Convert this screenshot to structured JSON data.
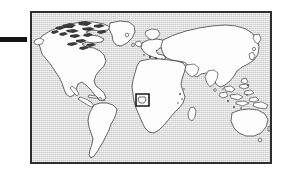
{
  "figure": {
    "kind": "world-locator-map",
    "projection_label": "",
    "caption": ""
  },
  "leader_bar": {
    "label": "",
    "color": "#141414"
  },
  "map": {
    "frame_color": "#2e2e2e",
    "ocean_color": "#cccccc",
    "land_color": "#fdfdfd",
    "coast_color": "#2b2b2b",
    "title": "",
    "graticule": false
  },
  "highlight": {
    "label": "",
    "region_name": "Gulf of Guinea / Central Africa",
    "box_color": "#181818"
  },
  "landmasses": [
    {
      "name": "North America"
    },
    {
      "name": "South America"
    },
    {
      "name": "Greenland"
    },
    {
      "name": "Europe"
    },
    {
      "name": "Africa"
    },
    {
      "name": "Asia"
    },
    {
      "name": "Australia"
    },
    {
      "name": "Madagascar"
    },
    {
      "name": "Japan"
    },
    {
      "name": "New Zealand"
    },
    {
      "name": "Indonesia"
    },
    {
      "name": "British Isles"
    },
    {
      "name": "Canadian Arctic Archipelago"
    }
  ]
}
